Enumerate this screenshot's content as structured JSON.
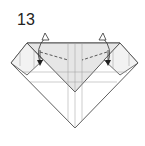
{
  "diagram": {
    "type": "origami-fold-step",
    "step_number": "13",
    "colors": {
      "paper": "#ffffff",
      "shaded_flap": "#e8e8e8",
      "line": "#333333",
      "crease": "#999999"
    },
    "annotations": [
      {
        "kind": "valley-fold-line",
        "side": "left"
      },
      {
        "kind": "valley-fold-line",
        "side": "right"
      },
      {
        "kind": "fold-arrow",
        "side": "left"
      },
      {
        "kind": "fold-arrow",
        "side": "right"
      }
    ]
  }
}
